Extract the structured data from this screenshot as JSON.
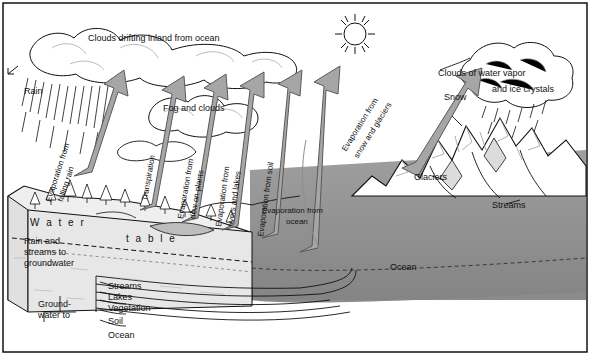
{
  "diagram": {
    "type": "hydrologic-cycle-cross-section",
    "palette": {
      "ink": "#111111",
      "paper": "#ffffff",
      "arrow_gray": "#9a9a9a",
      "arrow_outline": "#4a4a4a",
      "ocean_gray": "#8b8b8b",
      "ground_light": "#e8e8e8",
      "cloud_white": "#ffffff",
      "shade_mid": "#bdbdbd",
      "frame": "#000000"
    },
    "labels": {
      "clouds_drifting": "Clouds drifting inland from ocean",
      "rain": "Rain",
      "fog_and_clouds": "Fog and clouds",
      "clouds_of_water_vapor": "Clouds of water vapor",
      "and_ice_crystals": "and ice crystals",
      "snow": "Snow",
      "glaciers": "Glaciers",
      "streams_right": "Streams",
      "ocean_right": "Ocean",
      "water_table_water": "W a t e r",
      "water_table_table": "t a b l e",
      "rain_and_streams": "Rain and",
      "rain_and_streams2": "streams to",
      "rain_and_streams3": "groundwater",
      "groundwater_to": "Ground-",
      "groundwater_to2": "water to",
      "evap_falling_rain": "Evaporation from",
      "evap_falling_rain2": "falling rain",
      "transpiration": "Transpiration",
      "evap_plants": "Evaporation from",
      "evap_plants2": "dew on plants",
      "evap_rivers": "Evaporation from",
      "evap_rivers2": "rivers and lakes",
      "evap_soil": "Evaporation from soil",
      "evap_ocean": "Evaporation from",
      "evap_ocean2": "ocean",
      "evap_snow": "Evaporation from",
      "evap_snow2": "snow and glaciers"
    },
    "legend_list": [
      {
        "label": "Streams"
      },
      {
        "label": "Lakes"
      },
      {
        "label": "Vegetation"
      },
      {
        "label": "Soil"
      },
      {
        "label": "Ocean"
      }
    ],
    "sun": {
      "name": "sun",
      "rays": 12
    },
    "arrows": [
      {
        "name": "evap-falling-rain-arrow",
        "label": "Evaporation from falling rain"
      },
      {
        "name": "transpiration-arrow",
        "label": "Transpiration"
      },
      {
        "name": "evap-dew-plants-arrow",
        "label": "Evaporation from dew on plants"
      },
      {
        "name": "evap-rivers-lakes-arrow",
        "label": "Evaporation from rivers and lakes"
      },
      {
        "name": "evap-soil-arrow",
        "label": "Evaporation from soil"
      },
      {
        "name": "evap-ocean-arrow",
        "label": "Evaporation from ocean"
      },
      {
        "name": "evap-snow-glaciers-arrow",
        "label": "Evaporation from snow and glaciers"
      }
    ]
  }
}
